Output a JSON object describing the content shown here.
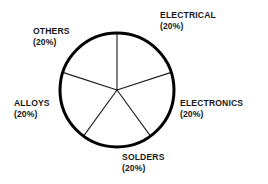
{
  "chart_data": {
    "type": "pie",
    "title": "",
    "subtitle": "",
    "xlabel": "",
    "ylabel": "",
    "legend_position": "none",
    "grid": false,
    "value_suffix": "%",
    "categories": [
      "ELECTRICAL",
      "ELECTRONICS",
      "SOLDERS",
      "ALLOYS",
      "OTHERS"
    ],
    "values": [
      20,
      20,
      20,
      20,
      20
    ],
    "slices": [
      {
        "label": "ELECTRICAL",
        "value": 20,
        "value_text": "(20%)",
        "start_angle_deg": 0,
        "end_angle_deg": 72,
        "fill": "#ffffff",
        "stroke": "#000000"
      },
      {
        "label": "ELECTRONICS",
        "value": 20,
        "value_text": "(20%)",
        "start_angle_deg": 72,
        "end_angle_deg": 144,
        "fill": "#ffffff",
        "stroke": "#000000"
      },
      {
        "label": "SOLDERS",
        "value": 20,
        "value_text": "(20%)",
        "start_angle_deg": 144,
        "end_angle_deg": 216,
        "fill": "#ffffff",
        "stroke": "#000000"
      },
      {
        "label": "ALLOYS",
        "value": 20,
        "value_text": "(20%)",
        "start_angle_deg": 216,
        "end_angle_deg": 288,
        "fill": "#ffffff",
        "stroke": "#000000"
      },
      {
        "label": "OTHERS",
        "value": 20,
        "value_text": "(20%)",
        "start_angle_deg": 288,
        "end_angle_deg": 360,
        "fill": "#ffffff",
        "stroke": "#000000"
      }
    ],
    "geometry": {
      "center_x": 117,
      "center_y": 90,
      "radius": 57,
      "outline_width": 3,
      "divider_width": 1.1
    },
    "colors": {
      "background": "#ffffff",
      "outline": "#000000",
      "divider": "#1a1a1a",
      "text": "#171717"
    }
  }
}
